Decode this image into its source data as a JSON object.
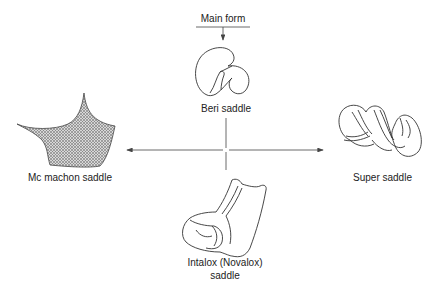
{
  "diagram": {
    "title_label": "Main form",
    "nodes": {
      "center_top": {
        "label": "Beri saddle"
      },
      "left": {
        "label": "Mc machon saddle"
      },
      "right": {
        "label": "Super saddle"
      },
      "bottom": {
        "label_line1": "Intalox (Novalox)",
        "label_line2": "saddle"
      }
    },
    "colors": {
      "line": "#444444",
      "hatch": "#9a9a9a",
      "text": "#222222"
    }
  }
}
